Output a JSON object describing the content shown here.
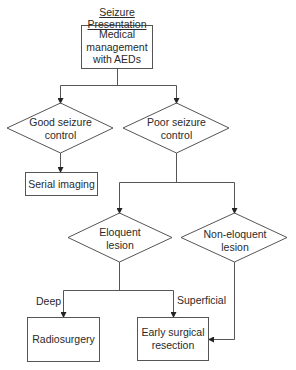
{
  "title": "Seizure Presentation",
  "nodes": {
    "start": {
      "label": "Medical management with AEDs",
      "lines": [
        "Medical",
        "management",
        "with AEDs"
      ],
      "shape": "rectangle"
    },
    "good": {
      "label": "Good seizure control",
      "lines": [
        "Good seizure",
        "control"
      ],
      "shape": "diamond"
    },
    "poor": {
      "label": "Poor seizure control",
      "lines": [
        "Poor seizure",
        "control"
      ],
      "shape": "diamond"
    },
    "serial": {
      "label": "Serial imaging",
      "shape": "rectangle"
    },
    "eloquent": {
      "label": "Eloquent lesion",
      "lines": [
        "Eloquent",
        "lesion"
      ],
      "shape": "diamond"
    },
    "noneloquent": {
      "label": "Non-eloquent lesion",
      "lines": [
        "Non-eloquent",
        "lesion"
      ],
      "shape": "diamond"
    },
    "radio": {
      "label": "Radiosurgery",
      "shape": "rectangle"
    },
    "resection": {
      "label": "Early surgical resection",
      "lines": [
        "Early surgical",
        "resection"
      ],
      "shape": "rectangle"
    }
  },
  "edges": [
    {
      "from": "start",
      "to": "good"
    },
    {
      "from": "start",
      "to": "poor"
    },
    {
      "from": "good",
      "to": "serial"
    },
    {
      "from": "poor",
      "to": "eloquent"
    },
    {
      "from": "poor",
      "to": "noneloquent"
    },
    {
      "from": "eloquent",
      "to": "radio",
      "label": "Deep"
    },
    {
      "from": "eloquent",
      "to": "resection",
      "label": "Superficial"
    },
    {
      "from": "noneloquent",
      "to": "resection"
    }
  ],
  "edge_labels": {
    "deep": "Deep",
    "superficial": "Superficial"
  }
}
